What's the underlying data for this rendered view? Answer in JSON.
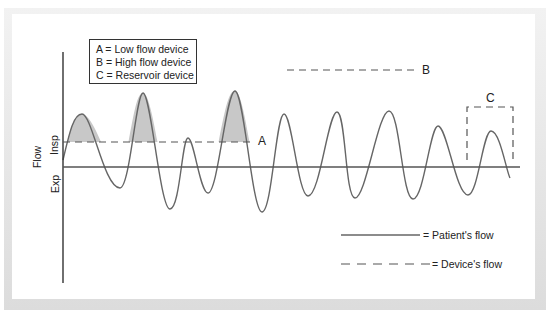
{
  "figure": {
    "legend_box": {
      "items": [
        "A = Low flow device",
        "B = High flow device",
        "C = Reservoir device"
      ]
    },
    "axis": {
      "ylabel": "Flow",
      "insp_label": "Insp",
      "exp_label": "Exp"
    },
    "markers": {
      "A": "A",
      "B": "B",
      "C": "C"
    },
    "key": {
      "patient_flow": "= Patient's flow",
      "device_flow": "= Device's flow"
    },
    "colors": {
      "curve": "#666666",
      "fill": "#c8c8c8",
      "axis": "#333333",
      "dash": "#555555",
      "frame": "#e8e8e8"
    }
  }
}
